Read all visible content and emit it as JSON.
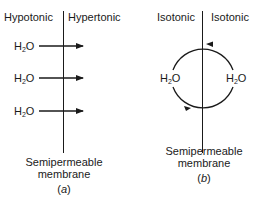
{
  "panel_a": {
    "left_label": "Hypotonic",
    "right_label": "Hypertonic",
    "molecule": {
      "main": "H",
      "sub": "2",
      "tail": "O"
    },
    "arrows": [
      {
        "label": "H2O",
        "direction": "right"
      },
      {
        "label": "H2O",
        "direction": "right"
      },
      {
        "label": "H2O",
        "direction": "right"
      }
    ],
    "membrane_label_line1": "Semipermeable",
    "membrane_label_line2": "membrane",
    "caption_open": "(",
    "caption_letter": "a",
    "caption_close": ")"
  },
  "panel_b": {
    "left_label": "Isotonic",
    "right_label": "Isotonic",
    "molecule": {
      "main": "H",
      "sub": "2",
      "tail": "O"
    },
    "flow": "circular exchange",
    "membrane_label_line1": "Semipermeable",
    "membrane_label_line2": "membrane",
    "caption_open": "(",
    "caption_letter": "b",
    "caption_close": ")"
  },
  "colors": {
    "ink": "#1a1a1a",
    "background": "#ffffff"
  }
}
